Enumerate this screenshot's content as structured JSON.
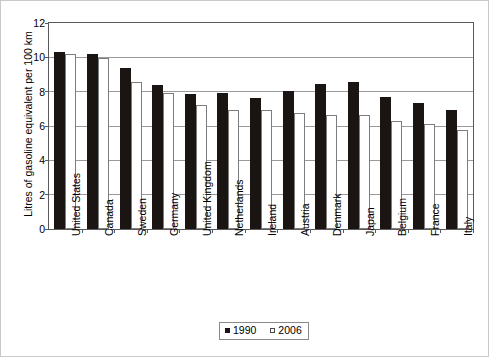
{
  "chart_data": {
    "type": "bar",
    "title": "",
    "xlabel": "",
    "ylabel": "Litres of gasoline equivalent per 100 km",
    "ylim": [
      0,
      12
    ],
    "yticks": [
      0,
      2,
      4,
      6,
      8,
      10,
      12
    ],
    "ytick_labels": [
      "0",
      "2",
      "4",
      "6",
      "8",
      "10",
      "12"
    ],
    "grid": true,
    "legend_position": "bottom-center",
    "categories": [
      "United States",
      "Canada",
      "Sweden",
      "Germany",
      "United Kingdom",
      "Netherlands",
      "Ireland",
      "Austria",
      "Denmark",
      "Japan",
      "Belgium",
      "France",
      "Italy"
    ],
    "series": [
      {
        "name": "1990",
        "color": "#1a1512",
        "values": [
          10.3,
          10.2,
          9.4,
          8.4,
          7.85,
          7.95,
          7.65,
          8.05,
          8.45,
          8.55,
          7.7,
          7.35,
          6.95
        ]
      },
      {
        "name": "2006",
        "color": "#ffffff",
        "values": [
          10.2,
          9.95,
          8.55,
          7.9,
          7.2,
          6.95,
          6.95,
          6.75,
          6.65,
          6.65,
          6.3,
          6.1,
          5.75
        ]
      }
    ]
  },
  "legend": {
    "items": [
      {
        "label": "1990",
        "swatch": "filled-square-swatch"
      },
      {
        "label": "2006",
        "swatch": "open-square-swatch"
      }
    ]
  }
}
